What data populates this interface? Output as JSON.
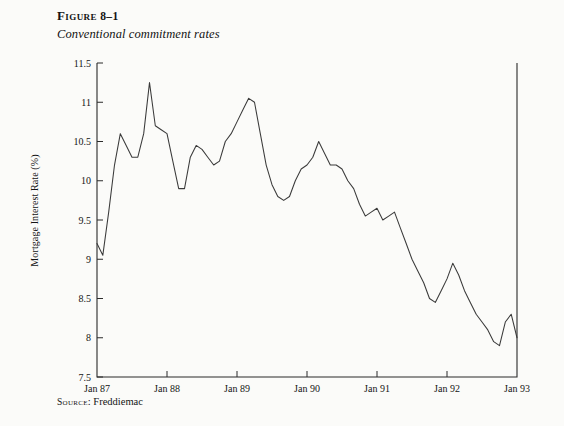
{
  "figure": {
    "number_prefix": "Figure",
    "number": "8–1",
    "title": "Conventional commitment rates",
    "source_prefix": "Source",
    "source_text": "Freddiemac"
  },
  "chart_data": {
    "type": "line",
    "title": "Conventional commitment rates",
    "xlabel": "",
    "ylabel": "Mortgage Interest Rate (%)",
    "ylim": [
      7.5,
      11.5
    ],
    "ytick_labels": [
      "11.5",
      "11",
      "10.5",
      "10",
      "9.5",
      "9",
      "8.5",
      "8",
      "7.5"
    ],
    "ytick_values": [
      11.5,
      11,
      10.5,
      10,
      9.5,
      9,
      8.5,
      8,
      7.5
    ],
    "xtick_labels": [
      "Jan 87",
      "Jan 88",
      "Jan 89",
      "Jan 90",
      "Jan 91",
      "Jan 92",
      "Jan 93"
    ],
    "xtick_values": [
      1987.0,
      1988.0,
      1989.0,
      1990.0,
      1991.0,
      1992.0,
      1993.0
    ],
    "xlim": [
      1987.0,
      1993.0
    ],
    "grid": false,
    "legend": "none",
    "line_color": "#3a3a3a",
    "series": [
      {
        "name": "Conventional commitment rate",
        "x": [
          1987.0,
          1987.083,
          1987.167,
          1987.25,
          1987.333,
          1987.417,
          1987.5,
          1987.583,
          1987.667,
          1987.75,
          1987.833,
          1987.917,
          1988.0,
          1988.083,
          1988.167,
          1988.25,
          1988.333,
          1988.417,
          1988.5,
          1988.583,
          1988.667,
          1988.75,
          1988.833,
          1988.917,
          1989.0,
          1989.083,
          1989.167,
          1989.25,
          1989.333,
          1989.417,
          1989.5,
          1989.583,
          1989.667,
          1989.75,
          1989.833,
          1989.917,
          1990.0,
          1990.083,
          1990.167,
          1990.25,
          1990.333,
          1990.417,
          1990.5,
          1990.583,
          1990.667,
          1990.75,
          1990.833,
          1990.917,
          1991.0,
          1991.083,
          1991.167,
          1991.25,
          1991.333,
          1991.417,
          1991.5,
          1991.583,
          1991.667,
          1991.75,
          1991.833,
          1991.917,
          1992.0,
          1992.083,
          1992.167,
          1992.25,
          1992.333,
          1992.417,
          1992.5,
          1992.583,
          1992.667,
          1992.75,
          1992.833,
          1992.917,
          1993.0
        ],
        "y": [
          9.2,
          9.05,
          9.6,
          10.2,
          10.6,
          10.45,
          10.3,
          10.3,
          10.6,
          11.25,
          10.7,
          10.65,
          10.6,
          10.25,
          9.9,
          9.9,
          10.3,
          10.45,
          10.4,
          10.3,
          10.2,
          10.25,
          10.5,
          10.6,
          10.75,
          10.9,
          11.05,
          11.0,
          10.6,
          10.2,
          9.95,
          9.8,
          9.75,
          9.8,
          10.0,
          10.15,
          10.2,
          10.3,
          10.5,
          10.35,
          10.2,
          10.2,
          10.15,
          10.0,
          9.9,
          9.7,
          9.55,
          9.6,
          9.65,
          9.5,
          9.55,
          9.6,
          9.4,
          9.2,
          9.0,
          8.85,
          8.7,
          8.5,
          8.45,
          8.6,
          8.75,
          8.95,
          8.8,
          8.6,
          8.45,
          8.3,
          8.2,
          8.1,
          7.95,
          7.9,
          8.2,
          8.3,
          8.0
        ]
      }
    ]
  }
}
